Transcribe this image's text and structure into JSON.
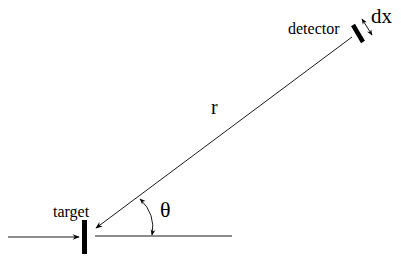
{
  "diagram": {
    "type": "scattering-geometry",
    "labels": {
      "detector": "detector",
      "dx": "dx",
      "r": "r",
      "theta": "θ",
      "target": "target"
    },
    "elements": [
      {
        "id": "incident-beam",
        "kind": "arrow",
        "from": [
          8,
          237
        ],
        "to": [
          79,
          237
        ]
      },
      {
        "id": "target-bar",
        "kind": "bar",
        "x": 84,
        "y1": 220,
        "y2": 254
      },
      {
        "id": "forward-axis",
        "kind": "line",
        "from": [
          95,
          236
        ],
        "to": [
          232,
          236
        ]
      },
      {
        "id": "scattered-path",
        "kind": "arrow",
        "from": [
          352,
          37
        ],
        "to": [
          95,
          228
        ]
      },
      {
        "id": "detector-bar",
        "kind": "bar",
        "from": [
          353,
          25
        ],
        "to": [
          363,
          42
        ]
      },
      {
        "id": "dx-arrow",
        "kind": "double-arrow",
        "from": [
          362,
          19
        ],
        "to": [
          372,
          35
        ]
      },
      {
        "id": "theta-arc",
        "kind": "double-arrow-arc",
        "from": [
          140,
          199
        ],
        "to": [
          152,
          235
        ]
      }
    ],
    "colors": {
      "stroke": "#000000",
      "background": "#ffffff"
    }
  }
}
